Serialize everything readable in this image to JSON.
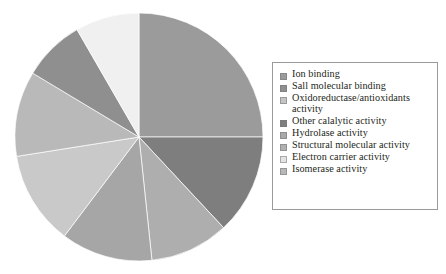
{
  "figure": {
    "background": "#ffffff",
    "legend_border_color": "#9a9a9a",
    "text_color": "#231f20"
  },
  "chart_data": {
    "type": "pie",
    "title": "",
    "xlabel": "",
    "ylabel": "",
    "legend_position": "right",
    "grid": false,
    "start_angle_deg": 0,
    "direction": "clockwise",
    "center": {
      "x": 125,
      "y": 125
    },
    "radius": 124,
    "categories": [
      "Ion binding",
      "Sall molecular binding",
      "Oxidoreductase/antioxidants\nactivity",
      "Other calalytic activity",
      "Hydrolase activity",
      "Structural molecular activity",
      "Electron carrier activity",
      "Isomerase activity"
    ],
    "values": [
      25.0,
      8.1,
      11.1,
      13.1,
      10.3,
      11.9,
      8.3,
      12.2
    ],
    "angles_deg": [
      90.0,
      29.0,
      40.0,
      47.0,
      37.0,
      43.0,
      30.0,
      44.0
    ],
    "colors": [
      "#9b9b9b",
      "#8f8f8f",
      "#b9b9b9",
      "#7e7e7e",
      "#aeaeae",
      "#a6a6a6",
      "#f0f0f0",
      "#c9c9c9"
    ],
    "slice_order_clockwise_from_top": [
      "Ion binding",
      "Other calalytic activity",
      "Hydrolase activity",
      "Structural molecular activity",
      "Isomerase activity",
      "Oxidoreductase/antioxidants activity",
      "Sall molecular binding",
      "Electron carrier activity"
    ]
  },
  "legend": {
    "items": [
      {
        "label": "Ion binding",
        "color": "#9b9b9b"
      },
      {
        "label": "Sall molecular binding",
        "color": "#8f8f8f"
      },
      {
        "label": "Oxidoreductase/antioxidants\nactivity",
        "color": "#c4c4c4"
      },
      {
        "label": "Other calalytic activity",
        "color": "#7e7e7e"
      },
      {
        "label": "Hydrolase activity",
        "color": "#a9a9a9"
      },
      {
        "label": "Structural molecular activity",
        "color": "#b1b1b1"
      },
      {
        "label": "Electron carrier activity",
        "color": "#e4e4e4"
      },
      {
        "label": "Isomerase activity",
        "color": "#b8b8b8"
      }
    ]
  }
}
